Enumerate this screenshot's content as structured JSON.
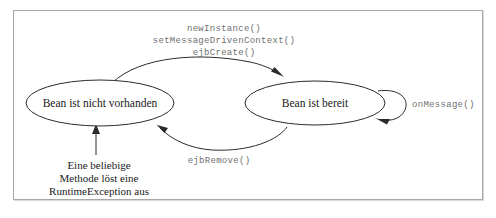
{
  "diagram": {
    "states": [
      {
        "id": "not-existing",
        "label": "Bean ist nicht vorhanden"
      },
      {
        "id": "ready",
        "label": "Bean ist bereit"
      }
    ],
    "transitions": {
      "create": {
        "lines": [
          "newInstance()",
          "setMessageDrivenContext()",
          "ejbCreate()"
        ]
      },
      "remove": {
        "label": "ejbRemove()"
      },
      "self_loop": {
        "label": "onMessage()"
      }
    },
    "note": {
      "lines": [
        "Eine beliebige",
        "Methode löst eine",
        "RuntimeException aus"
      ]
    },
    "colors": {
      "stroke": "#2b2b2b",
      "code_text": "#6f6f6f",
      "state_text": "#1a1a1a",
      "frame": "#a8a8a8",
      "background": "#ffffff"
    }
  }
}
